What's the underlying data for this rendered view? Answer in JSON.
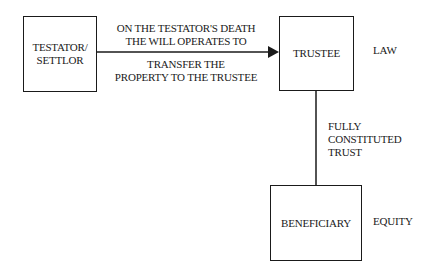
{
  "diagram": {
    "nodes": {
      "testator": {
        "label_line1": "TESTATOR/",
        "label_line2": "SETTLOR"
      },
      "trustee": {
        "label": "TRUSTEE"
      },
      "beneficiary": {
        "label": "BENEFICIARY"
      }
    },
    "edges": {
      "testator_to_trustee": {
        "above_line1": "ON THE TESTATOR'S DEATH",
        "above_line2": "THE WILL OPERATES TO",
        "below_line1": "TRANSFER THE",
        "below_line2": "PROPERTY TO THE TRUSTEE"
      },
      "trustee_to_beneficiary": {
        "line1": "FULLY",
        "line2": "CONSTITUTED",
        "line3": "TRUST"
      }
    },
    "side_labels": {
      "law": "LAW",
      "equity": "EQUITY"
    }
  }
}
